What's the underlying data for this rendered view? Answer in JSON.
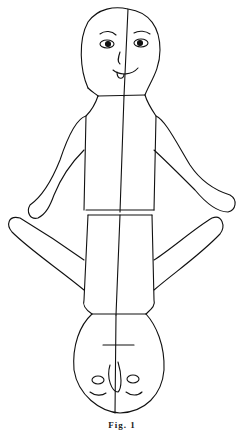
{
  "figure": {
    "caption": "Fig. 1",
    "colors": {
      "line": "#111111",
      "background": "#ffffff"
    }
  }
}
